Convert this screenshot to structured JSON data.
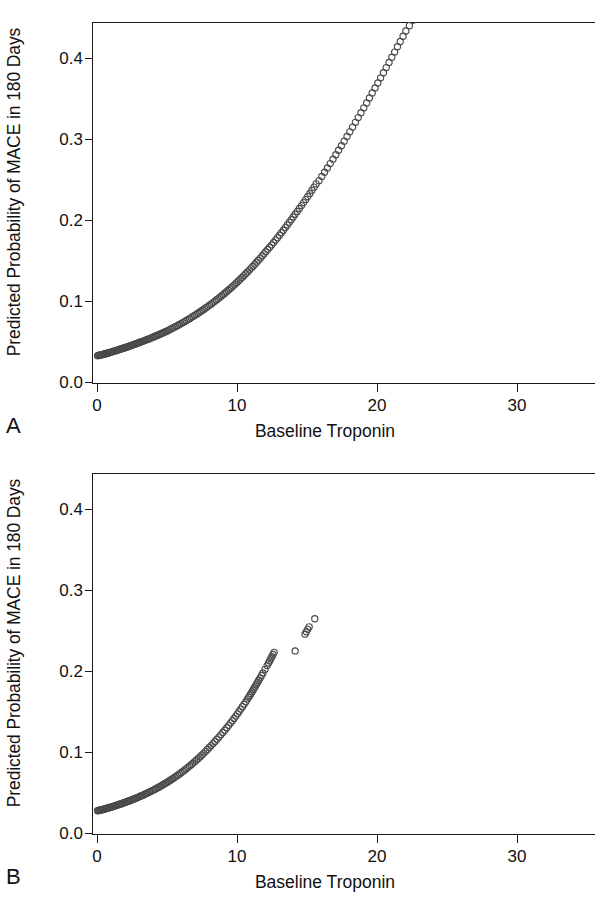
{
  "figure": {
    "type": "scatter-figure",
    "panel_count": 2
  },
  "panels": [
    {
      "letter": "A",
      "ylabel": "Predicted Probability of MACE in 180 Days",
      "xlabel": "Baseline Troponin",
      "yticks": [
        "0.0",
        "0.1",
        "0.2",
        "0.3",
        "0.4"
      ],
      "xticks": [
        "0",
        "10",
        "20",
        "30"
      ]
    },
    {
      "letter": "B",
      "ylabel": "Predicted Probability of MACE in 180 Days",
      "xlabel": "Baseline Troponin",
      "yticks": [
        "0.0",
        "0.1",
        "0.2",
        "0.3",
        "0.4"
      ],
      "xticks": [
        "0",
        "10",
        "20",
        "30"
      ]
    }
  ],
  "style": {
    "marker_stroke": "#4a4a4a",
    "marker_fill": "none",
    "axis_color": "#1a1a1a",
    "background": "#ffffff",
    "marker_radius_px": 3.1,
    "marker_shape": "open-circle"
  },
  "chart_data": [
    {
      "type": "scatter",
      "panel": "A",
      "title": "",
      "xlabel": "Baseline Troponin",
      "ylabel": "Predicted Probability of MACE in 180 Days",
      "xlim": [
        -0.4,
        35.5
      ],
      "ylim": [
        0.0,
        0.447
      ],
      "xticks": [
        0,
        10,
        20,
        30
      ],
      "yticks": [
        0.0,
        0.1,
        0.2,
        0.3,
        0.4
      ],
      "grid": false,
      "legend": null,
      "marker": "open-circle",
      "n_points": 236,
      "note": "Monotonic increasing convex curve of predicted probability versus baseline troponin; points dense at low troponin and sparse above 20.",
      "x": [
        0.0,
        0.05,
        0.1,
        0.15,
        0.2,
        0.25,
        0.3,
        0.35,
        0.4,
        0.45,
        0.5,
        0.55,
        0.6,
        0.65,
        0.7,
        0.75,
        0.8,
        0.85,
        0.9,
        0.95,
        1.0,
        1.06,
        1.12,
        1.18,
        1.24,
        1.3,
        1.36,
        1.42,
        1.48,
        1.55,
        1.62,
        1.69,
        1.76,
        1.83,
        1.9,
        1.97,
        2.04,
        2.11,
        2.18,
        2.26,
        2.34,
        2.42,
        2.5,
        2.58,
        2.66,
        2.74,
        2.82,
        2.9,
        2.98,
        3.07,
        3.16,
        3.25,
        3.34,
        3.43,
        3.52,
        3.61,
        3.7,
        3.8,
        3.9,
        4.0,
        4.1,
        4.2,
        4.3,
        4.4,
        4.5,
        4.6,
        4.7,
        4.8,
        4.9,
        5.0,
        5.12,
        5.24,
        5.36,
        5.48,
        5.6,
        5.72,
        5.84,
        5.96,
        6.08,
        6.2,
        6.32,
        6.44,
        6.56,
        6.68,
        6.8,
        6.92,
        7.04,
        7.16,
        7.28,
        7.4,
        7.52,
        7.64,
        7.76,
        7.88,
        8.0,
        8.12,
        8.24,
        8.36,
        8.48,
        8.6,
        8.72,
        8.84,
        8.96,
        9.08,
        9.2,
        9.32,
        9.44,
        9.56,
        9.68,
        9.8,
        9.92,
        10.05,
        10.18,
        10.31,
        10.44,
        10.57,
        10.7,
        10.83,
        10.96,
        11.09,
        11.22,
        11.35,
        11.48,
        11.61,
        11.74,
        11.87,
        12.0,
        12.14,
        12.28,
        12.42,
        12.56,
        12.7,
        12.84,
        12.98,
        13.12,
        13.26,
        13.4,
        13.54,
        13.68,
        13.82,
        13.96,
        14.1,
        14.25,
        14.4,
        14.55,
        14.7,
        14.85,
        15.0,
        15.15,
        15.3,
        15.45,
        15.6,
        15.8,
        16.0,
        16.2,
        16.4,
        16.6,
        16.8,
        17.0,
        17.2,
        17.4,
        17.6,
        17.8,
        18.0,
        18.2,
        18.4,
        18.6,
        18.8,
        19.0,
        19.2,
        19.4,
        19.6,
        19.8,
        20.0,
        20.2,
        20.4,
        20.6,
        20.8,
        21.0,
        21.2,
        21.4,
        21.6,
        21.8,
        22.0,
        22.25,
        22.5,
        22.75,
        23.0,
        23.3,
        23.6,
        23.9,
        24.2,
        24.5,
        24.8,
        25.1,
        25.4,
        25.7,
        26.0,
        26.2,
        26.4,
        26.6,
        26.9,
        27.2,
        27.5,
        27.8,
        28.1,
        28.4,
        28.7,
        29.0,
        29.9,
        31.7,
        32.3,
        32.6,
        34.2
      ],
      "y": [
        0.035,
        0.0352,
        0.0354,
        0.0356,
        0.0358,
        0.036,
        0.0362,
        0.0364,
        0.0366,
        0.0368,
        0.037,
        0.0373,
        0.0375,
        0.0378,
        0.038,
        0.0383,
        0.0386,
        0.0388,
        0.0391,
        0.0394,
        0.0397,
        0.04,
        0.0403,
        0.0406,
        0.0409,
        0.0412,
        0.0416,
        0.0419,
        0.0422,
        0.0426,
        0.043,
        0.0434,
        0.0438,
        0.0442,
        0.0446,
        0.045,
        0.0454,
        0.0458,
        0.0462,
        0.0467,
        0.0472,
        0.0477,
        0.0482,
        0.0487,
        0.0492,
        0.0497,
        0.0502,
        0.0507,
        0.0513,
        0.0518,
        0.0524,
        0.053,
        0.0536,
        0.0542,
        0.0548,
        0.0554,
        0.056,
        0.0567,
        0.0574,
        0.0581,
        0.0589,
        0.0596,
        0.0603,
        0.0611,
        0.0618,
        0.0626,
        0.0634,
        0.0642,
        0.065,
        0.0658,
        0.0669,
        0.0679,
        0.069,
        0.0701,
        0.0712,
        0.0723,
        0.0735,
        0.0746,
        0.0758,
        0.077,
        0.0782,
        0.0795,
        0.0807,
        0.082,
        0.0833,
        0.0846,
        0.0859,
        0.0873,
        0.0887,
        0.0901,
        0.0915,
        0.0929,
        0.0944,
        0.0959,
        0.0974,
        0.0989,
        0.1005,
        0.1021,
        0.1037,
        0.1053,
        0.107,
        0.1087,
        0.1104,
        0.1121,
        0.1139,
        0.1157,
        0.1175,
        0.1193,
        0.1212,
        0.1231,
        0.1251,
        0.1272,
        0.1294,
        0.1316,
        0.1338,
        0.1361,
        0.1384,
        0.1407,
        0.1431,
        0.1455,
        0.1479,
        0.1504,
        0.1529,
        0.1555,
        0.1581,
        0.1607,
        0.1634,
        0.1661,
        0.1689,
        0.1718,
        0.1747,
        0.1777,
        0.1807,
        0.1837,
        0.1868,
        0.1899,
        0.1931,
        0.1963,
        0.1996,
        0.2029,
        0.2062,
        0.2096,
        0.2131,
        0.2167,
        0.2203,
        0.224,
        0.2277,
        0.2315,
        0.2353,
        0.2392,
        0.2431,
        0.2471,
        0.2511,
        0.2563,
        0.2615,
        0.2668,
        0.2722,
        0.2776,
        0.2831,
        0.2886,
        0.2942,
        0.2999,
        0.3056,
        0.3114,
        0.3172,
        0.3231,
        0.329,
        0.335,
        0.341,
        0.3471,
        0.3532,
        0.3594,
        0.3656,
        0.3718,
        0.3781,
        0.3844,
        0.3907,
        0.3971,
        0.4035,
        0.4099,
        0.4164,
        0.4229,
        0.4294,
        0.4359,
        0.4425,
        0.449,
        0.4556,
        0.4638,
        0.4721,
        0.4803,
        0.4886,
        0.4986,
        0.5086,
        0.5186,
        0.5286,
        0.5386,
        0.5486,
        0.5586,
        0.5685,
        0.5785,
        0.5884,
        0.595,
        0.6016,
        0.6081,
        0.618,
        0.6278,
        0.6376,
        0.6474,
        0.6571,
        0.6667,
        0.6764,
        0.6859,
        0.7141,
        0.7694,
        0.7874,
        0.7963,
        0.8436
      ]
    },
    {
      "type": "scatter",
      "panel": "B",
      "title": "",
      "xlabel": "Baseline Troponin",
      "ylabel": "Predicted Probability of MACE in 180 Days",
      "xlim": [
        -0.4,
        35.5
      ],
      "ylim": [
        0.0,
        0.447
      ],
      "xticks": [
        0,
        10,
        20,
        30
      ],
      "yticks": [
        0.0,
        0.1,
        0.2,
        0.3,
        0.4
      ],
      "grid": false,
      "legend": null,
      "marker": "open-circle",
      "n_points": 176,
      "note": "Same convex relationship but troponin range truncated near 15.5; maximum predicted probability about 0.267.",
      "x": [
        0.0,
        0.05,
        0.1,
        0.15,
        0.2,
        0.25,
        0.3,
        0.35,
        0.4,
        0.45,
        0.5,
        0.56,
        0.62,
        0.68,
        0.74,
        0.8,
        0.86,
        0.92,
        0.98,
        1.04,
        1.1,
        1.17,
        1.24,
        1.31,
        1.38,
        1.45,
        1.52,
        1.59,
        1.66,
        1.73,
        1.8,
        1.88,
        1.96,
        2.04,
        2.12,
        2.2,
        2.28,
        2.36,
        2.44,
        2.52,
        2.6,
        2.69,
        2.78,
        2.87,
        2.96,
        3.05,
        3.14,
        3.23,
        3.32,
        3.41,
        3.5,
        3.6,
        3.7,
        3.8,
        3.9,
        4.0,
        4.1,
        4.2,
        4.3,
        4.4,
        4.5,
        4.61,
        4.72,
        4.83,
        4.94,
        5.05,
        5.16,
        5.27,
        5.38,
        5.49,
        5.6,
        5.72,
        5.84,
        5.96,
        6.08,
        6.2,
        6.32,
        6.44,
        6.56,
        6.68,
        6.8,
        6.93,
        7.06,
        7.19,
        7.32,
        7.45,
        7.58,
        7.71,
        7.84,
        7.97,
        8.1,
        8.24,
        8.38,
        8.52,
        8.66,
        8.8,
        8.94,
        9.08,
        9.22,
        9.36,
        9.5,
        9.62,
        9.74,
        9.86,
        9.98,
        10.1,
        10.22,
        10.34,
        10.46,
        10.58,
        10.7,
        10.78,
        10.86,
        10.94,
        11.02,
        11.1,
        11.18,
        11.26,
        11.34,
        11.42,
        11.5,
        11.6,
        11.7,
        11.8,
        11.95,
        12.1,
        12.2,
        12.28,
        12.36,
        12.44,
        12.52,
        12.6,
        14.1,
        14.8,
        14.9,
        15.0,
        15.1,
        15.5
      ],
      "y": [
        0.03,
        0.0302,
        0.0304,
        0.0306,
        0.0308,
        0.031,
        0.0312,
        0.0314,
        0.0317,
        0.0319,
        0.0321,
        0.0324,
        0.0327,
        0.033,
        0.0333,
        0.0336,
        0.0339,
        0.0342,
        0.0345,
        0.0348,
        0.0352,
        0.0356,
        0.036,
        0.0364,
        0.0368,
        0.0372,
        0.0376,
        0.038,
        0.0384,
        0.0389,
        0.0393,
        0.0398,
        0.0403,
        0.0408,
        0.0413,
        0.0418,
        0.0423,
        0.0429,
        0.0434,
        0.044,
        0.0445,
        0.0452,
        0.0458,
        0.0465,
        0.0471,
        0.0478,
        0.0485,
        0.0492,
        0.0499,
        0.0507,
        0.0514,
        0.0522,
        0.0531,
        0.0539,
        0.0548,
        0.0557,
        0.0566,
        0.0575,
        0.0585,
        0.0594,
        0.0604,
        0.0615,
        0.0626,
        0.0637,
        0.0649,
        0.0661,
        0.0673,
        0.0685,
        0.0698,
        0.0711,
        0.0724,
        0.0739,
        0.0754,
        0.0769,
        0.0785,
        0.0801,
        0.0817,
        0.0834,
        0.0851,
        0.0868,
        0.0886,
        0.0906,
        0.0926,
        0.0946,
        0.0967,
        0.0989,
        0.1011,
        0.1033,
        0.1056,
        0.108,
        0.1104,
        0.1129,
        0.1155,
        0.1182,
        0.1209,
        0.1237,
        0.1265,
        0.1294,
        0.1324,
        0.1354,
        0.1385,
        0.1412,
        0.144,
        0.1468,
        0.1496,
        0.1525,
        0.1555,
        0.1585,
        0.1615,
        0.1646,
        0.1678,
        0.17,
        0.1722,
        0.1745,
        0.1768,
        0.1791,
        0.1815,
        0.1838,
        0.1862,
        0.1886,
        0.1911,
        0.194,
        0.197,
        0.2,
        0.2046,
        0.2092,
        0.2124,
        0.215,
        0.2176,
        0.2202,
        0.2229,
        0.2256,
        0.2273,
        0.248,
        0.251,
        0.254,
        0.257,
        0.267
      ]
    }
  ]
}
